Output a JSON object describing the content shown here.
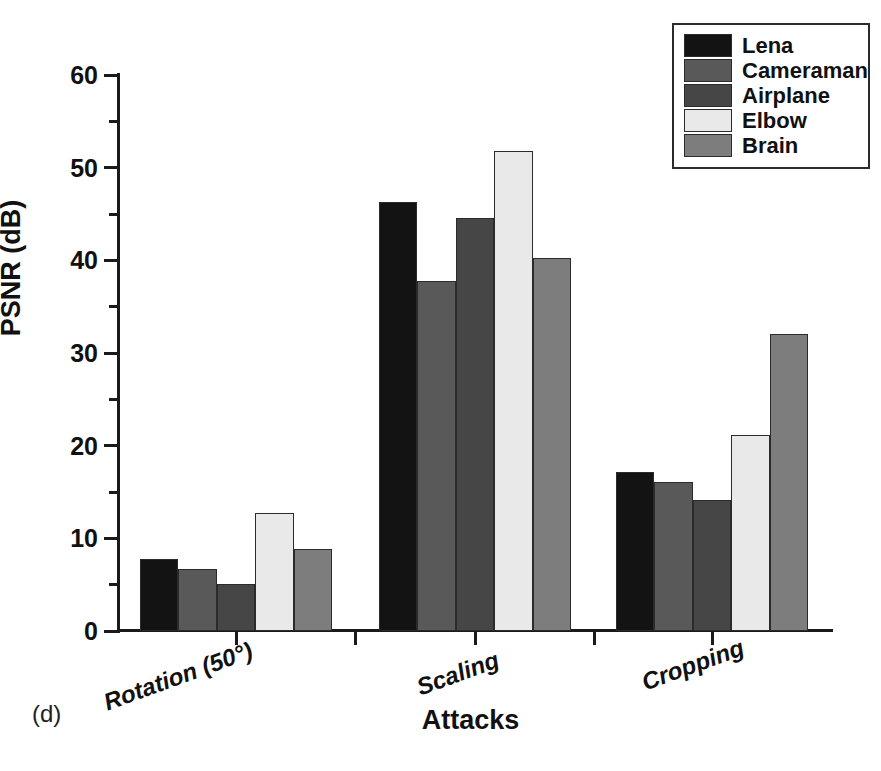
{
  "panel_label": "(d)",
  "axes": {
    "ylabel": "PSNR (dB)",
    "xlabel": "Attacks",
    "y_ticks": [
      "0",
      "10",
      "20",
      "30",
      "40",
      "50",
      "60"
    ],
    "ylim": [
      0,
      60
    ]
  },
  "legend": {
    "items": [
      {
        "label": "Lena",
        "color": "#131313"
      },
      {
        "label": "Cameraman",
        "color": "#595959"
      },
      {
        "label": "Airplane",
        "color": "#464646"
      },
      {
        "label": "Elbow",
        "color": "#e9e9e9"
      },
      {
        "label": "Brain",
        "color": "#7d7d7d"
      }
    ]
  },
  "chart_data": {
    "type": "bar",
    "title": "",
    "xlabel": "Attacks",
    "ylabel": "PSNR (dB)",
    "ylim": [
      0,
      60
    ],
    "ytick_step": 10,
    "minor_tick_step": 5,
    "grid": false,
    "legend_position": "top-right",
    "categories": [
      "Rotation (50°)",
      "Scaling",
      "Cropping"
    ],
    "series": [
      {
        "name": "Lena",
        "color": "#131313",
        "values": [
          7.8,
          46.3,
          17.2
        ]
      },
      {
        "name": "Cameraman",
        "color": "#595959",
        "values": [
          6.7,
          37.8,
          16.1
        ]
      },
      {
        "name": "Airplane",
        "color": "#464646",
        "values": [
          5.1,
          44.6,
          14.1
        ]
      },
      {
        "name": "Elbow",
        "color": "#e9e9e9",
        "values": [
          12.7,
          51.8,
          21.1
        ]
      },
      {
        "name": "Brain",
        "color": "#7d7d7d",
        "values": [
          8.9,
          40.2,
          32.1
        ]
      }
    ]
  }
}
